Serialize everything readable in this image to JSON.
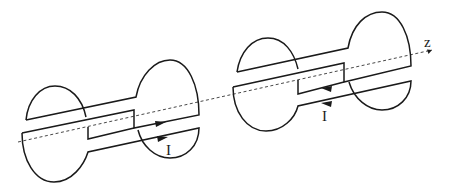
{
  "diagram": {
    "axis": {
      "label": "z"
    },
    "coils": [
      {
        "id": "left-coil",
        "current_label": "I",
        "current_direction": "toward +z"
      },
      {
        "id": "right-coil",
        "current_label": "I",
        "current_direction": "toward -z"
      }
    ],
    "colors": {
      "line": "#1a1a1a",
      "background": "#ffffff"
    }
  }
}
